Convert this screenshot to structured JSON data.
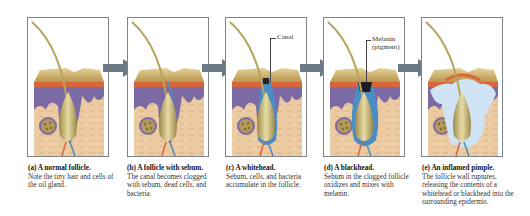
{
  "figure": {
    "panels": [
      {
        "id": "a",
        "title": "(a) A normal follicle.",
        "description": "Note the tiny hair and cells of the oil gland.",
        "state": "normal"
      },
      {
        "id": "b",
        "title": "(b) A follicle with sebum.",
        "description": "The canal becomes clogged with sebum, dead cells, and bacteria.",
        "state": "sebum"
      },
      {
        "id": "c",
        "title": "(c) A whitehead.",
        "description": "Sebum, cells, and bacteria accumulate in the follicle.",
        "state": "whitehead"
      },
      {
        "id": "d",
        "title": "(d) A blackhead.",
        "description": "Sebum in the clogged follicle oxidizes and mixes with melanin.",
        "state": "blackhead"
      },
      {
        "id": "e",
        "title": "(e) An inflamed pimple.",
        "description": "The follicle wall ruptures, releasing the contents of a whitehead or blackhead into the surrounding epidermis.",
        "state": "inflamed"
      }
    ],
    "labels": {
      "canal": "Canal",
      "melanin_line1": "Melanin",
      "melanin_line2": "(pigment)"
    },
    "colors": {
      "frame": "#7d8389",
      "arrow": "#6b7a86",
      "skin_top": "#c9ad6a",
      "epidermis_red": "#d9653a",
      "purple_layer": "#7b6aa3",
      "dermis": "#eac8a0",
      "hair": "#b9a25a",
      "sebum_blue": "#4a8cc4",
      "pus_light": "#cfe3f4"
    }
  }
}
